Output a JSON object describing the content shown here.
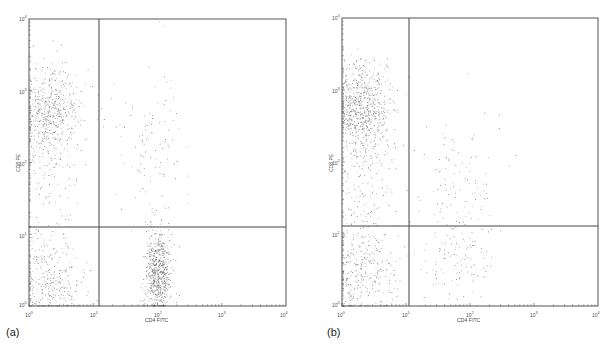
{
  "figure": {
    "panels": [
      {
        "id": "a",
        "label": "(a)",
        "xlabel": "CD4 FITC",
        "ylabel": "CD8 PE"
      },
      {
        "id": "b",
        "label": "(b)",
        "xlabel": "CD4 FITC",
        "ylabel": "CD8 PE"
      }
    ],
    "tick_base": "10",
    "tick_exponents": [
      "0",
      "1",
      "2",
      "3",
      "4"
    ],
    "colors": {
      "frame": "#555555",
      "gate": "#444444",
      "dot": "#6a6a6a",
      "background": "#ffffff"
    }
  },
  "chart_data": [
    {
      "type": "scatter",
      "title": "(a)",
      "xlabel": "CD4 FITC",
      "ylabel": "CD8 PE",
      "xscale": "log",
      "yscale": "log",
      "xlim": [
        1,
        10000
      ],
      "ylim": [
        1,
        10000
      ],
      "x_ticks": [
        "10^0",
        "10^1",
        "10^2",
        "10^3",
        "10^4"
      ],
      "y_ticks": [
        "10^0",
        "10^1",
        "10^2",
        "10^3",
        "10^4"
      ],
      "grid": false,
      "legend": null,
      "quadrant_gates": {
        "x": 12,
        "y": 12
      },
      "populations": [
        {
          "name": "CD8+ CD4- (upper-left)",
          "x_center": 2,
          "y_center": 600,
          "density": "high",
          "note": "dense cluster near top-left, trailing down"
        },
        {
          "name": "CD4- CD8- (lower-left)",
          "x_center": 2,
          "y_center": 2,
          "density": "medium"
        },
        {
          "name": "CD4+ CD8- (lower-right)",
          "x_center": 100,
          "y_center": 3,
          "density": "high",
          "note": "tight vertical column at ~10^2"
        },
        {
          "name": "CD4+ CD8+ (upper-right)",
          "x_center": 90,
          "y_center": 200,
          "density": "sparse"
        }
      ]
    },
    {
      "type": "scatter",
      "title": "(b)",
      "xlabel": "CD4 FITC",
      "ylabel": "CD8 PE",
      "xscale": "log",
      "yscale": "log",
      "xlim": [
        1,
        10000
      ],
      "ylim": [
        1,
        10000
      ],
      "x_ticks": [
        "10^0",
        "10^1",
        "10^2",
        "10^3",
        "10^4"
      ],
      "y_ticks": [
        "10^0",
        "10^1",
        "10^2",
        "10^3",
        "10^4"
      ],
      "grid": false,
      "legend": null,
      "quadrant_gates": {
        "x": 12,
        "y": 12
      },
      "populations": [
        {
          "name": "CD8+ CD4- (upper-left)",
          "x_center": 2,
          "y_center": 700,
          "density": "very high",
          "note": "dense cluster at top-left"
        },
        {
          "name": "CD4- CD8- (lower-left)",
          "x_center": 2,
          "y_center": 3,
          "density": "medium"
        },
        {
          "name": "CD4+ CD8- (lower-right)",
          "x_center": 60,
          "y_center": 4,
          "density": "sparse",
          "note": "diffuse scatter, reduced CD4 population"
        },
        {
          "name": "CD4+ CD8+ (upper-right)",
          "x_center": 70,
          "y_center": 60,
          "density": "sparse",
          "note": "diagonal streak toward ~10^2"
        }
      ]
    }
  ]
}
